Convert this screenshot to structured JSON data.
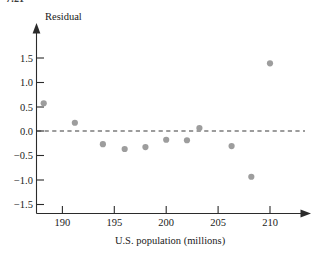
{
  "figure": {
    "number_fragment": "7.21"
  },
  "chart_data": {
    "type": "scatter",
    "title": "",
    "xlabel": "U.S. population (millions)",
    "ylabel": "Residual",
    "xlim": [
      187.0,
      212.2
    ],
    "ylim": [
      -1.62,
      1.78
    ],
    "grid": false,
    "legend": null,
    "xticks": [
      190,
      195,
      200,
      205,
      210
    ],
    "xticklabels": [
      "190",
      "195",
      "200",
      "205",
      "210"
    ],
    "yticks": [
      -1.5,
      -1.0,
      -0.5,
      0.0,
      0.5,
      1.0,
      1.5
    ],
    "yticklabels": [
      "−1.5",
      "−1.0",
      "−0.5",
      "0.0",
      "0.5",
      "1.0",
      "1.5"
    ],
    "reference_line": {
      "name": "zero-residual-line",
      "y": 0.0,
      "style": "dashed"
    },
    "point_color": "#9d9d9d",
    "points": [
      {
        "x": 188.2,
        "y": 0.57
      },
      {
        "x": 191.2,
        "y": 0.17
      },
      {
        "x": 193.9,
        "y": -0.27
      },
      {
        "x": 196.0,
        "y": -0.37
      },
      {
        "x": 198.0,
        "y": -0.33
      },
      {
        "x": 200.0,
        "y": -0.18
      },
      {
        "x": 202.0,
        "y": -0.19
      },
      {
        "x": 203.2,
        "y": 0.06
      },
      {
        "x": 206.3,
        "y": -0.31
      },
      {
        "x": 208.2,
        "y": -0.94
      },
      {
        "x": 210.0,
        "y": 1.39
      }
    ],
    "x": [
      188.2,
      191.2,
      193.9,
      196.0,
      198.0,
      200.0,
      202.0,
      203.2,
      206.3,
      208.2,
      210.0
    ],
    "values": [
      0.57,
      0.17,
      -0.27,
      -0.37,
      -0.33,
      -0.18,
      -0.19,
      0.06,
      -0.31,
      -0.94,
      1.39
    ]
  }
}
